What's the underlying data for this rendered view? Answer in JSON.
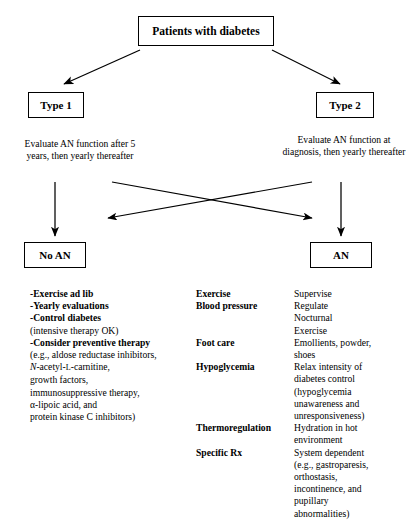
{
  "diagram": {
    "title": "Patients with diabetes",
    "type": "clinical-algorithm-flowchart",
    "nodes": {
      "root": "Patients with diabetes",
      "type1": "Type 1",
      "type2": "Type 2",
      "no_an": "No AN",
      "an": "AN"
    },
    "captions": {
      "left": "Evaluate AN function after 5 years, then yearly thereafter",
      "right": "Evaluate AN function at diagnosis, then yearly thereafter"
    },
    "edges": [
      {
        "from": "root",
        "to": "type1",
        "style": "diagonal-arrow"
      },
      {
        "from": "root",
        "to": "type2",
        "style": "diagonal-arrow"
      },
      {
        "from": "type1",
        "to": "no_an",
        "style": "vertical-arrow"
      },
      {
        "from": "type2",
        "to": "an",
        "style": "vertical-arrow"
      },
      {
        "from": "right-path",
        "to": "no_an",
        "style": "crossing-diagonal-arrow"
      },
      {
        "from": "left-path",
        "to": "an",
        "style": "crossing-diagonal-arrow"
      }
    ]
  },
  "no_an_panel": {
    "lines": [
      {
        "bold": "-Exercise ad lib",
        "normal": ""
      },
      {
        "bold": "-Yearly evaluations",
        "normal": ""
      },
      {
        "bold": "-Control diabetes",
        "normal": ""
      },
      {
        "bold": "",
        "normal": "(intensive therapy OK)"
      },
      {
        "bold": "-Consider preventive therapy",
        "normal": ""
      },
      {
        "bold": "",
        "normal": "(e.g., aldose reductase inhibitors,"
      },
      {
        "bold": "",
        "normal": "N-acetyl-L-carnitine,"
      },
      {
        "bold": "",
        "normal": "growth factors,"
      },
      {
        "bold": "",
        "normal": "immunosuppressive therapy,"
      },
      {
        "bold": "",
        "normal": "α-lipoic acid, and"
      },
      {
        "bold": "",
        "normal": "protein kinase C inhibitors)"
      }
    ]
  },
  "an_panel": {
    "rows": [
      {
        "term": "Exercise",
        "desc": [
          "Supervise"
        ]
      },
      {
        "term": "Blood pressure",
        "desc": [
          "Regulate",
          "Nocturnal",
          "Exercise"
        ]
      },
      {
        "term": "Foot care",
        "desc": [
          "Emollients, powder,",
          "shoes"
        ]
      },
      {
        "term": "Hypoglycemia",
        "desc": [
          "Relax intensity of",
          "diabetes control",
          "(hypoglycemia",
          "unawareness and",
          "unresponsiveness)"
        ]
      },
      {
        "term": "Thermoregulation",
        "desc": [
          "Hydration in hot",
          "environment"
        ]
      },
      {
        "term": "Specific Rx",
        "desc": [
          "System dependent",
          "(e.g., gastroparesis,",
          "orthostasis,",
          "incontinence, and",
          "pupillary",
          "abnormalities)"
        ]
      }
    ]
  },
  "colors": {
    "ink": "#000000",
    "background": "#ffffff",
    "border": "#000000"
  }
}
